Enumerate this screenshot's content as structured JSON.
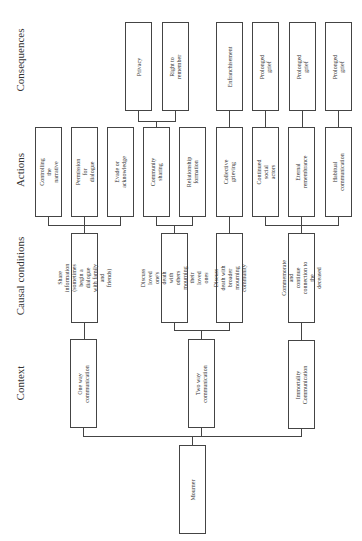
{
  "column_labels": {
    "consequences": "Consequences",
    "actions": "Actions",
    "causal_conditions": "Causal conditions",
    "context": "Context"
  },
  "root": {
    "label": "Mourner"
  },
  "context": [
    {
      "label": "One way communication"
    },
    {
      "label": "Two way communication"
    },
    {
      "label": "Immortality\nCommunication"
    }
  ],
  "causal_conditions": [
    {
      "label": "Share information\n(sometimes begin a dialogue\nwith family and friends)"
    },
    {
      "label": "Discuss loved one's death\nwith others mourning their\nloved ones"
    },
    {
      "label": "Discuss death with broader\nmourning community"
    },
    {
      "label": "Commemorate and\ncontinue connection to the\ndeceased"
    }
  ],
  "actions": [
    {
      "label": "Controlling the narrative"
    },
    {
      "label": "Permission for dialogue"
    },
    {
      "label": "Evade or acknowledge"
    },
    {
      "label": "Community sharing"
    },
    {
      "label": "Relationship formation"
    },
    {
      "label": "Collective grieving"
    },
    {
      "label": "Continued social actors"
    },
    {
      "label": "Eternal remembrance"
    },
    {
      "label": "Habitual communication"
    }
  ],
  "consequences": [
    {
      "label": "Privacy"
    },
    {
      "label": "Right to remember"
    },
    {
      "label": "Enfranchisement"
    },
    {
      "label": "Prolonged grief"
    },
    {
      "label": "Prolonged grief"
    },
    {
      "label": "Prolonged grief"
    }
  ]
}
